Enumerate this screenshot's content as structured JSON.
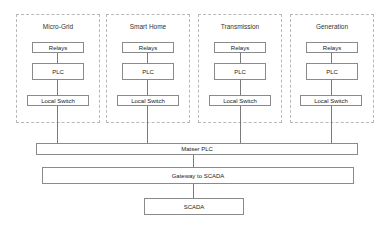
{
  "diagram": {
    "groups": [
      {
        "title": "Micro-Grid",
        "relays": "Relays",
        "plc": "PLC",
        "switch": "Local Switch"
      },
      {
        "title": "Smart Home",
        "relays": "Relays",
        "plc": "PLC",
        "switch": "Local Switch"
      },
      {
        "title": "Transmission",
        "relays": "Relays",
        "plc": "PLC",
        "switch": "Local Switch"
      },
      {
        "title": "Generation",
        "relays": "Relays",
        "plc": "PLC",
        "switch": "Local Switch"
      }
    ],
    "master_plc": "Matser PLC",
    "gateway": "Gateway to SCADA",
    "scada": "SCADA"
  },
  "colors": {
    "box_border": "#8a8a8a",
    "group_border": "#b8b8b8",
    "connector": "#7a7a7a"
  }
}
